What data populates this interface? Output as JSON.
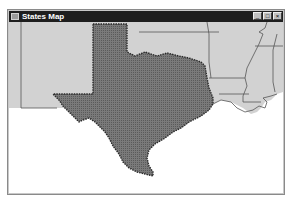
{
  "window": {
    "title": "States Map",
    "controls": {
      "minimize": "_",
      "maximize": "□",
      "close": "×"
    }
  },
  "map": {
    "highlighted_state": "Texas",
    "neighbor_states": [
      "New Mexico",
      "Oklahoma",
      "Arkansas",
      "Louisiana",
      "Mississippi",
      "Colorado",
      "Kansas",
      "Missouri"
    ],
    "colors": {
      "highlight_fill": "#6e6e6e",
      "highlight_border": "#2a2a2a",
      "state_fill": "#d2d2d2",
      "state_border": "#555555",
      "water": "#ffffff"
    }
  }
}
